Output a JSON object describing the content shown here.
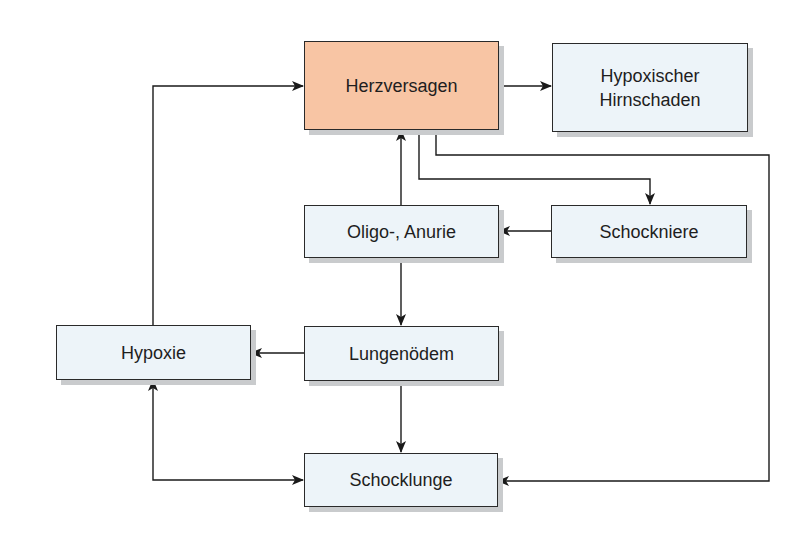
{
  "diagram": {
    "type": "flowchart",
    "language": "de",
    "colors": {
      "primary_node_fill": "#f8c5a4",
      "node_fill": "#edf4f9",
      "border": "#2a2a2a",
      "shadow": "#c9cbcd",
      "edge": "#1a1a1a"
    },
    "nodes": {
      "herzversagen": {
        "label": "Herzversagen",
        "highlight": true
      },
      "hirnschaden": {
        "label": "Hypoxischer\nHirnschaden"
      },
      "oligo_anurie": {
        "label": "Oligo-, Anurie"
      },
      "schockniere": {
        "label": "Schockniere"
      },
      "hypoxie": {
        "label": "Hypoxie"
      },
      "lungenoedem": {
        "label": "Lungenödem"
      },
      "schocklunge": {
        "label": "Schocklunge"
      }
    },
    "edges": [
      {
        "from": "Herzversagen",
        "to": "Hypoxischer Hirnschaden"
      },
      {
        "from": "Herzversagen",
        "to": "Schockniere"
      },
      {
        "from": "Herzversagen",
        "to": "Schocklunge"
      },
      {
        "from": "Oligo-, Anurie",
        "to": "Herzversagen"
      },
      {
        "from": "Schockniere",
        "to": "Oligo-, Anurie"
      },
      {
        "from": "Oligo-, Anurie",
        "to": "Lungenödem"
      },
      {
        "from": "Lungenödem",
        "to": "Hypoxie"
      },
      {
        "from": "Lungenödem",
        "to": "Schocklunge"
      },
      {
        "from": "Hypoxie",
        "to": "Herzversagen"
      },
      {
        "from": "Hypoxie",
        "to": "Schocklunge",
        "bidirectional": true
      }
    ]
  }
}
